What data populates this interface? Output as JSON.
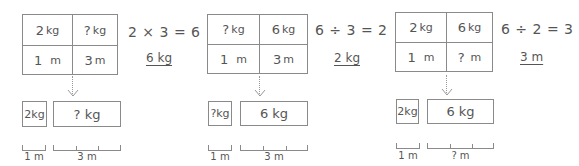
{
  "panels": [
    {
      "table": {
        "top_left": "2",
        "top_left_unit": "kg",
        "top_right": "?",
        "top_right_unit": "kg",
        "bottom_left": "1",
        "bottom_left_unit": "m",
        "bottom_right": "3",
        "bottom_right_unit": "m"
      },
      "equation": "2 × 3 = 6",
      "answer": "6 kg",
      "small_box": "2kg",
      "big_box": "? kg",
      "small_ruler_label": "1 m",
      "big_ruler_label": "3 m"
    },
    {
      "table": {
        "top_left": "?",
        "top_left_unit": "kg",
        "top_right": "6",
        "top_right_unit": "kg",
        "bottom_left": "1",
        "bottom_left_unit": "m",
        "bottom_right": "3",
        "bottom_right_unit": "m"
      },
      "equation": "6 ÷ 3 = 2",
      "answer": "2 kg",
      "small_box": "?kg",
      "big_box": "6 kg",
      "small_ruler_label": "1 m",
      "big_ruler_label": "3 m"
    },
    {
      "table": {
        "top_left": "2",
        "top_left_unit": "kg",
        "top_right": "6",
        "top_right_unit": "kg",
        "bottom_left": "1",
        "bottom_left_unit": "m",
        "bottom_right": "?",
        "bottom_right_unit": "m"
      },
      "equation": "6 ÷ 2 = 3",
      "answer": "3 m",
      "small_box": "2kg",
      "big_box": "6 kg",
      "small_ruler_label": "1 m",
      "big_ruler_label": "? m"
    }
  ],
  "colors": {
    "line": "#8a8a8a",
    "text": "#555555",
    "arrow": "#999999"
  }
}
